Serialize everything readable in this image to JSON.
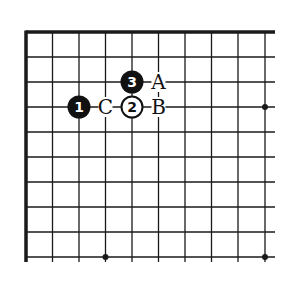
{
  "diagram": {
    "type": "go-board-corner",
    "grid": {
      "columns": 10,
      "rows": 10,
      "x": [
        26,
        52.5,
        79,
        105.5,
        132,
        158.5,
        185,
        211.5,
        238,
        265
      ],
      "y": [
        32,
        57,
        82,
        107,
        132,
        157,
        182,
        207,
        232,
        257
      ],
      "thick_edges": [
        "top",
        "left"
      ],
      "line_color": "#1a1a1a"
    },
    "star_points": [
      {
        "col": 9,
        "row": 3
      },
      {
        "col": 3,
        "row": 9
      },
      {
        "col": 9,
        "row": 9
      }
    ],
    "stones": [
      {
        "color": "black",
        "number": "1",
        "col": 2,
        "row": 3
      },
      {
        "color": "white",
        "number": "2",
        "col": 4,
        "row": 3
      },
      {
        "color": "black",
        "number": "3",
        "col": 4,
        "row": 2
      }
    ],
    "labels": [
      {
        "text": "A",
        "col": 5,
        "row": 2
      },
      {
        "text": "B",
        "col": 5,
        "row": 3
      },
      {
        "text": "C",
        "col": 3,
        "row": 3
      }
    ]
  }
}
